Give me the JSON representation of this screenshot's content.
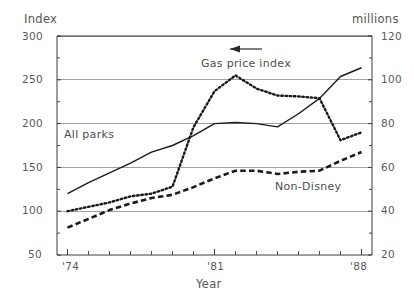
{
  "chart_data": {
    "type": "line",
    "title": "",
    "xlabel": "Year",
    "ylabel": "Index",
    "y2label": "millions",
    "xlim": [
      1973.5,
      1988.5
    ],
    "ylim": [
      50,
      300
    ],
    "y2lim": [
      20,
      120
    ],
    "grid": true,
    "legend_position": "inline-annotations",
    "x_ticks": [
      "'74",
      "'81",
      "'88"
    ],
    "x_tick_values": [
      1974,
      1981,
      1988
    ],
    "x_minor_ticks": [
      1974,
      1975,
      1976,
      1977,
      1978,
      1979,
      1980,
      1981,
      1982,
      1983,
      1984,
      1985,
      1986,
      1987,
      1988
    ],
    "y_ticks": [
      "50",
      "100",
      "150",
      "200",
      "250",
      "300"
    ],
    "y_tick_values": [
      50,
      100,
      150,
      200,
      250,
      300
    ],
    "y2_ticks": [
      "20",
      "40",
      "60",
      "80",
      "100",
      "120"
    ],
    "y2_tick_values": [
      20,
      40,
      60,
      80,
      100,
      120
    ],
    "x": [
      1974,
      1975,
      1976,
      1977,
      1978,
      1979,
      1980,
      1981,
      1982,
      1983,
      1984,
      1985,
      1986,
      1987,
      1988
    ],
    "series": [
      {
        "name": "All parks",
        "style": "solid",
        "axis": "right",
        "values": [
          48.0,
          53.0,
          57.5,
          62.0,
          67.0,
          70.0,
          74.5,
          80.0,
          80.5,
          80.0,
          78.5,
          84.5,
          91.5,
          101.5,
          105.5
        ],
        "index_values": [
          133,
          145,
          157,
          169,
          181,
          188,
          199,
          205,
          206,
          205,
          200,
          213,
          231,
          255,
          264
        ]
      },
      {
        "name": "Gas price index",
        "style": "dotted",
        "axis": "left",
        "values": [
          100,
          105,
          110,
          117,
          120,
          128,
          196,
          237,
          255,
          240,
          232,
          231,
          229,
          181,
          190
        ],
        "arrow": "left"
      },
      {
        "name": "Non-Disney",
        "style": "dashed",
        "axis": "right",
        "values": [
          32.5,
          36.5,
          40.5,
          43.5,
          46.0,
          47.5,
          51.0,
          55.0,
          58.5,
          58.5,
          57.0,
          58.0,
          58.5,
          63.0,
          67.0
        ],
        "index_values": [
          81,
          91,
          101,
          108,
          115,
          119,
          127,
          137,
          146,
          146,
          142,
          145,
          146,
          157,
          167
        ]
      }
    ],
    "annotations": [
      {
        "name": "gas-price-index-label",
        "text": "Gas price index",
        "x": 1981.0,
        "y": 268
      },
      {
        "name": "all-parks-label",
        "text": "All parks",
        "x": 1975.3,
        "y": 186
      },
      {
        "name": "non-disney-label",
        "text": "Non-Disney",
        "x": 1985.0,
        "y": 131
      },
      {
        "name": "left-arrow",
        "text": "←",
        "x": 1981.0,
        "y": 282
      }
    ]
  },
  "axes": {
    "left_title": "Index",
    "right_title": "millions",
    "bottom_title": "Year"
  },
  "labels": {
    "all_parks": "All parks",
    "gas_price_index": "Gas price index",
    "non_disney": "Non-Disney"
  },
  "colors": {
    "line": "#1a1a1a",
    "grid": "#8a8a8a",
    "axis": "#3a3a3a",
    "text": "#555555",
    "background": "#ffffff"
  }
}
